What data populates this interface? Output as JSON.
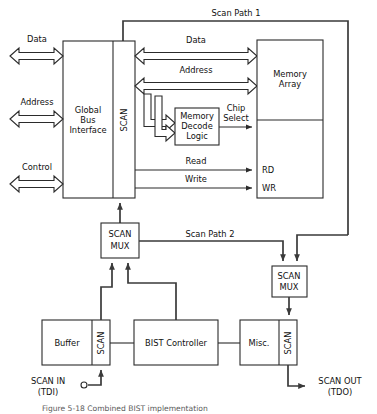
{
  "figure": {
    "type": "block-diagram",
    "caption": "Figure 5-18  Combined BIST implementation"
  },
  "blocks": {
    "global_bus_interface": "Global\nBus\nInterface",
    "global_bus_interface_lines": [
      "Global",
      "Bus",
      "Interface"
    ],
    "gbi_scan": "SCAN",
    "memory_array_lines": [
      "Memory",
      "Array"
    ],
    "memory_decode_lines": [
      "Memory",
      "Decode",
      "Logic"
    ],
    "scan_mux_upper_lines": [
      "SCAN",
      "MUX"
    ],
    "scan_mux_lower_lines": [
      "SCAN",
      "MUX"
    ],
    "buffer": "Buffer",
    "buffer_scan": "SCAN",
    "bist_controller": "BIST Controller",
    "misc": "Misc.",
    "misc_scan": "SCAN"
  },
  "signals": {
    "data_external": "Data",
    "address_external": "Address",
    "control_external": "Control",
    "data_bus": "Data",
    "address_bus": "Address",
    "chip_select_lines": [
      "Chip",
      "Select"
    ],
    "read": "Read",
    "write": "Write",
    "rd": "RD",
    "wr": "WR",
    "scan_path_1": "Scan Path 1",
    "scan_path_2": "Scan Path 2",
    "scan_in_lines": [
      "SCAN IN",
      "(TDI)"
    ],
    "scan_out_lines": [
      "SCAN OUT",
      "(TDO)"
    ]
  },
  "colors": {
    "stroke": "#2b2b2b",
    "thick_stroke": "#3a3a3a",
    "background": "#ffffff",
    "text": "#111111",
    "caption_text": "#5a5a5a"
  }
}
